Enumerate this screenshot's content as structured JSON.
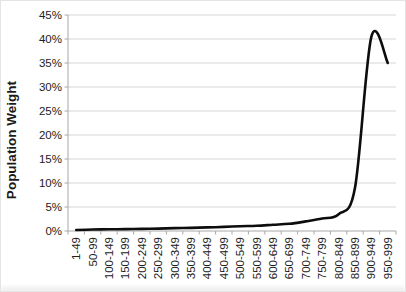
{
  "chart_data": {
    "type": "line",
    "title": "",
    "ylabel": "Population Weight",
    "xlabel": "",
    "categories": [
      "1-49",
      "50-99",
      "100-149",
      "150-199",
      "200-249",
      "250-299",
      "300-349",
      "350-399",
      "400-449",
      "450-499",
      "500-549",
      "550-599",
      "600-649",
      "650-699",
      "700-749",
      "750-799",
      "800-849",
      "850-899",
      "900-949",
      "950-999"
    ],
    "values": [
      0.2,
      0.3,
      0.35,
      0.4,
      0.45,
      0.5,
      0.6,
      0.65,
      0.75,
      0.85,
      1.0,
      1.1,
      1.3,
      1.5,
      2.0,
      2.6,
      3.5,
      9.0,
      40.5,
      35.0
    ],
    "values_unit": "%",
    "y_ticks": [
      "0%",
      "5%",
      "10%",
      "15%",
      "20%",
      "25%",
      "30%",
      "35%",
      "40%",
      "45%"
    ],
    "ylim": [
      0,
      45
    ],
    "grid": true,
    "legend": "none",
    "smoothed": true,
    "colors": {
      "line": "#0d0d0d",
      "gridline": "#d6d6d6",
      "axis": "#a8a8a8",
      "tick_text": "#212121",
      "background": "#ffffff"
    }
  }
}
